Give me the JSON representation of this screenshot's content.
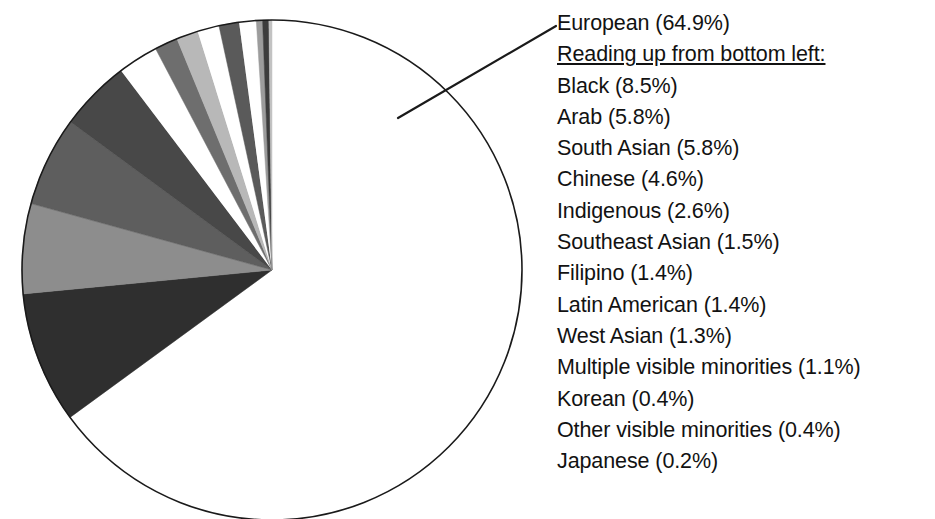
{
  "chart_data": {
    "type": "pie",
    "title": "",
    "subtitle": "",
    "xlabel": "",
    "ylabel": "",
    "legend_position": "right",
    "grid": false,
    "start_angle_deg": 0,
    "direction": "clockwise",
    "units": "percent",
    "note": "Reading up from bottom left:",
    "categories": [
      "European",
      "Black",
      "Arab",
      "South Asian",
      "Chinese",
      "Indigenous",
      "Southeast Asian",
      "Filipino",
      "Latin American",
      "West Asian",
      "Multiple visible minorities",
      "Korean",
      "Other visible minorities",
      "Japanese"
    ],
    "values": [
      64.9,
      8.5,
      5.8,
      5.8,
      4.6,
      2.6,
      1.5,
      1.4,
      1.4,
      1.3,
      1.1,
      0.4,
      0.4,
      0.2
    ],
    "colors": [
      "#ffffff",
      "#2f2f2f",
      "#8d8d8d",
      "#5e5e5e",
      "#484848",
      "#ffffff",
      "#6e6e6e",
      "#b8b8b8",
      "#ffffff",
      "#5a5a5a",
      "#ffffff",
      "#9c9c9c",
      "#3c3c3c",
      "#c2c2c2"
    ],
    "slices": [
      {
        "label": "European",
        "value": 64.9,
        "label_text": "European (64.9%)",
        "color": "#ffffff"
      },
      {
        "label": "Black",
        "value": 8.5,
        "label_text": "Black (8.5%)",
        "color": "#2f2f2f"
      },
      {
        "label": "Arab",
        "value": 5.8,
        "label_text": "Arab (5.8%)",
        "color": "#8d8d8d"
      },
      {
        "label": "South Asian",
        "value": 5.8,
        "label_text": "South Asian (5.8%)",
        "color": "#5e5e5e"
      },
      {
        "label": "Chinese",
        "value": 4.6,
        "label_text": "Chinese (4.6%)",
        "color": "#484848"
      },
      {
        "label": "Indigenous",
        "value": 2.6,
        "label_text": "Indigenous (2.6%)",
        "color": "#ffffff"
      },
      {
        "label": "Southeast Asian",
        "value": 1.5,
        "label_text": "Southeast Asian (1.5%)",
        "color": "#6e6e6e"
      },
      {
        "label": "Filipino",
        "value": 1.4,
        "label_text": "Filipino (1.4%)",
        "color": "#b8b8b8"
      },
      {
        "label": "Latin American",
        "value": 1.4,
        "label_text": "Latin American (1.4%)",
        "color": "#ffffff"
      },
      {
        "label": "West Asian",
        "value": 1.3,
        "label_text": "West Asian (1.3%)",
        "color": "#5a5a5a"
      },
      {
        "label": "Multiple visible minorities",
        "value": 1.1,
        "label_text": "Multiple visible minorities (1.1%)",
        "color": "#ffffff"
      },
      {
        "label": "Korean",
        "value": 0.4,
        "label_text": "Korean (0.4%)",
        "color": "#9c9c9c"
      },
      {
        "label": "Other visible minorities",
        "value": 0.4,
        "label_text": "Other visible minorities (0.4%)",
        "color": "#3c3c3c"
      },
      {
        "label": "Japanese",
        "value": 0.2,
        "label_text": "Japanese (0.2%)",
        "color": "#c2c2c2"
      }
    ]
  },
  "legend": {
    "rows": [
      {
        "text": "European (64.9%)",
        "heading": false
      },
      {
        "text": "Reading up from bottom left:",
        "heading": true
      },
      {
        "text": "Black (8.5%)",
        "heading": false
      },
      {
        "text": "Arab (5.8%)",
        "heading": false
      },
      {
        "text": "South Asian (5.8%)",
        "heading": false
      },
      {
        "text": "Chinese (4.6%)",
        "heading": false
      },
      {
        "text": "Indigenous (2.6%)",
        "heading": false
      },
      {
        "text": "Southeast Asian (1.5%)",
        "heading": false
      },
      {
        "text": "Filipino (1.4%)",
        "heading": false
      },
      {
        "text": "Latin American (1.4%)",
        "heading": false
      },
      {
        "text": "West Asian (1.3%)",
        "heading": false
      },
      {
        "text": "Multiple visible minorities (1.1%)",
        "heading": false
      },
      {
        "text": "Korean (0.4%)",
        "heading": false
      },
      {
        "text": "Other visible minorities (0.4%)",
        "heading": false
      },
      {
        "text": "Japanese (0.2%)",
        "heading": false
      }
    ]
  },
  "style": {
    "outline_color": "#1a1a1a",
    "leader_color": "#1a1a1a",
    "text_color": "#121212",
    "background": "#ffffff"
  },
  "geometry": {
    "center_x": 272,
    "center_y": 270,
    "radius": 250
  }
}
